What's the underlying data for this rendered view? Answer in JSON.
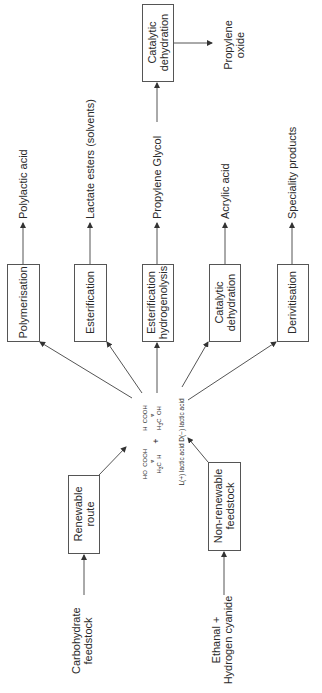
{
  "diagram": {
    "center": {
      "molecule_l": {
        "groups": [
          "COOH",
          "HO",
          "H3C",
          "H"
        ]
      },
      "molecule_d": {
        "groups": [
          "COOH",
          "H",
          "H3C",
          "OH"
        ]
      },
      "plus": "+",
      "caption_l": "L(+) lactic acid",
      "caption_d": "D(−) lactic acid"
    },
    "inputs": [
      {
        "feedstock": "Carbohydrate feedstock",
        "feed_line1": "Carbohydrate",
        "feed_line2": "feedstock",
        "route": "Renewable route",
        "route_line1": "Renewable",
        "route_line2": "route"
      },
      {
        "feedstock": "Ethanal + Hydrogen cyanide",
        "feed_line1": "Ethanal +",
        "feed_line2": "Hydrogen cyanide",
        "route": "Non-renewable feedstock",
        "route_line1": "Non-renewable",
        "route_line2": "feedstock"
      }
    ],
    "processes": [
      {
        "line1": "Polymerisation",
        "line2": "",
        "product": "Polylactic acid"
      },
      {
        "line1": "Esterification",
        "line2": "",
        "product": "Lactate esters (solvents)"
      },
      {
        "line1": "Esterification",
        "line2": "hydrogenolysis",
        "product": "Propylene Glycol"
      },
      {
        "line1": "Catalytic",
        "line2": "dehydration",
        "product": "Acrylic acid"
      },
      {
        "line1": "Derivitisation",
        "line2": "",
        "product": "Speciality products"
      }
    ],
    "secondary": {
      "from": "Propylene Glycol",
      "process_line1": "Catalytic",
      "process_line2": "dehydration",
      "product_line1": "Propylene",
      "product_line2": "oxide"
    },
    "colors": {
      "line": "#555555",
      "text": "#2a2a2a",
      "background": "#ffffff"
    }
  }
}
